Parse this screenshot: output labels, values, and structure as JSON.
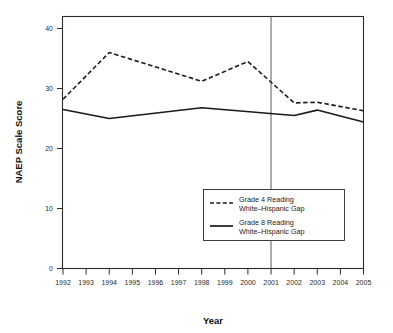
{
  "chart_data": {
    "type": "line",
    "title": "",
    "xlabel": "Year",
    "ylabel": "NAEP Scale Score",
    "x": [
      1992,
      1993,
      1994,
      1995,
      1996,
      1997,
      1998,
      1999,
      2000,
      2001,
      2002,
      2003,
      2004,
      2005
    ],
    "xtick_labels": [
      "1992",
      "1993",
      "1994",
      "1995",
      "1996",
      "1997",
      "1998",
      "1999",
      "2000",
      "2001",
      "2002",
      "2003",
      "2004",
      "2005"
    ],
    "ytick_labels": [
      "0",
      "10",
      "20",
      "30",
      "40"
    ],
    "yticks": [
      0,
      10,
      20,
      30,
      40
    ],
    "xlim": [
      1992,
      2005
    ],
    "ylim": [
      0,
      42
    ],
    "grid": false,
    "legend_position": "lower-right-inside",
    "annotations": [
      {
        "type": "vertical-reference-line",
        "x": 2001,
        "label": "2001"
      }
    ],
    "series": [
      {
        "name": "Grade 4 Reading White–Hispanic Gap",
        "style": "dashed",
        "points": [
          {
            "x": 1992,
            "y": 28.2
          },
          {
            "x": 1994,
            "y": 36.0
          },
          {
            "x": 1998,
            "y": 31.2
          },
          {
            "x": 2000,
            "y": 34.5
          },
          {
            "x": 2002,
            "y": 27.6
          },
          {
            "x": 2003,
            "y": 27.7
          },
          {
            "x": 2005,
            "y": 26.3
          }
        ]
      },
      {
        "name": "Grade 8 Reading White–Hispanic Gap",
        "style": "solid",
        "points": [
          {
            "x": 1992,
            "y": 26.5
          },
          {
            "x": 1994,
            "y": 25.0
          },
          {
            "x": 1998,
            "y": 26.8
          },
          {
            "x": 2002,
            "y": 25.5
          },
          {
            "x": 2003,
            "y": 26.4
          },
          {
            "x": 2005,
            "y": 24.4
          }
        ]
      }
    ]
  },
  "axes": {
    "x_title": "Year",
    "y_title": "NAEP Scale Score"
  },
  "legend": {
    "entries": [
      {
        "line1": "Grade 4 Reading",
        "line2": "White–Hispanic Gap",
        "style": "dashed"
      },
      {
        "line1": "Grade 8 Reading",
        "line2": "White–Hispanic Gap",
        "style": "solid"
      }
    ]
  }
}
